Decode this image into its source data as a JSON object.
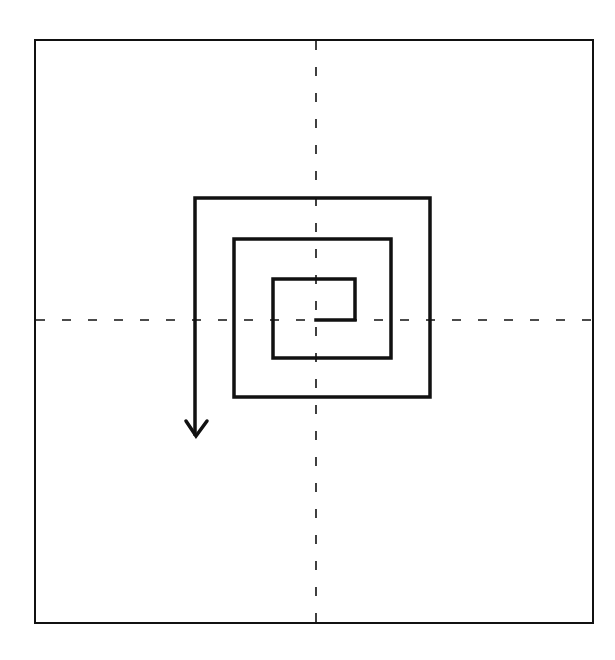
{
  "diagram": {
    "type": "square-spiral",
    "background": "#ffffff",
    "stroke_color": "#111111",
    "frame": {
      "x": 35,
      "y": 40,
      "width": 558,
      "height": 583,
      "stroke_width": 2
    },
    "axes": {
      "style": "dashed",
      "dash": "9 17",
      "stroke_width": 1.6,
      "vertical": {
        "x": 316,
        "y1": 41,
        "y2": 622
      },
      "horizontal": {
        "y": 320,
        "x1": 36,
        "x2": 592
      }
    },
    "spiral": {
      "stroke_width": 3.5,
      "origin": [
        316,
        320
      ],
      "points": [
        [
          316,
          320
        ],
        [
          355,
          320
        ],
        [
          355,
          279
        ],
        [
          273,
          279
        ],
        [
          273,
          358
        ],
        [
          391,
          358
        ],
        [
          391,
          239
        ],
        [
          234,
          239
        ],
        [
          234,
          397
        ],
        [
          430,
          397
        ],
        [
          430,
          198
        ],
        [
          195,
          198
        ],
        [
          195,
          434
        ]
      ],
      "arrow": {
        "direction": "down",
        "tip": [
          196,
          436
        ],
        "left_wing": [
          186,
          421
        ],
        "right_wing": [
          207,
          421
        ]
      }
    }
  }
}
